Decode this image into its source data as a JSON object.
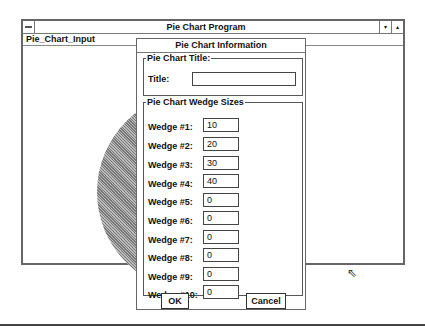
{
  "window": {
    "title": "Pie Chart Program",
    "menu": [
      "Pie_Chart_Input"
    ],
    "minimize_glyph": "▾",
    "maximize_glyph": "▴"
  },
  "dialog": {
    "title": "Pie Chart Information",
    "title_group": {
      "legend": "Pie Chart Title:",
      "label": "Title:",
      "value": ""
    },
    "wedge_group": {
      "legend": "Pie Chart Wedge Sizes",
      "wedges": [
        {
          "label": "Wedge #1:",
          "value": "10"
        },
        {
          "label": "Wedge #2:",
          "value": "20"
        },
        {
          "label": "Wedge #3:",
          "value": "30"
        },
        {
          "label": "Wedge #4:",
          "value": "40"
        },
        {
          "label": "Wedge #5:",
          "value": "0"
        },
        {
          "label": "Wedge #6:",
          "value": "0"
        },
        {
          "label": "Wedge #7:",
          "value": "0"
        },
        {
          "label": "Wedge #8:",
          "value": "0"
        },
        {
          "label": "Wedge #9:",
          "value": "0"
        },
        {
          "label": "Wedge #10:",
          "value": "0"
        }
      ]
    },
    "ok_label": "OK",
    "cancel_label": "Cancel"
  },
  "cursor_glyph": "⇖"
}
